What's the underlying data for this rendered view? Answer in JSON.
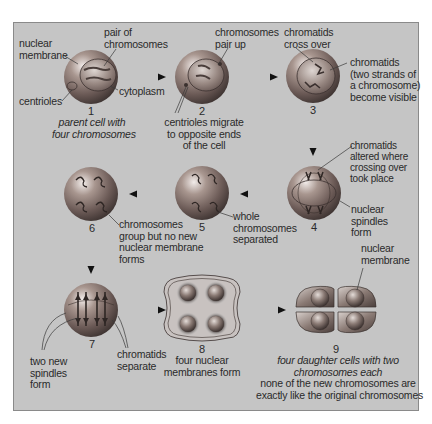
{
  "diagram": {
    "colors": {
      "panel_bg": "#c5c5c5",
      "cell_dark": "#5a4d4a",
      "cell_light": "#d8d0cc",
      "arrow": "#222222"
    },
    "stages": [
      {
        "number": "1",
        "caption": "parent cell with four chromosomes",
        "labels": [
          "nuclear membrane",
          "pair of chromosomes",
          "centrioles",
          "cytoplasm"
        ]
      },
      {
        "number": "2",
        "caption": "centrioles migrate to opposite ends of the cell",
        "labels": [
          "chromosomes pair up"
        ]
      },
      {
        "number": "3",
        "caption": "",
        "labels": [
          "chromatids cross over",
          "chromatids (two strands of a chromosome) become visible"
        ]
      },
      {
        "number": "4",
        "caption": "",
        "labels": [
          "chromatids altered where crossing over took place",
          "nuclear spindles form"
        ]
      },
      {
        "number": "5",
        "caption": "",
        "labels": [
          "whole chromosomes separated"
        ]
      },
      {
        "number": "6",
        "caption": "",
        "labels": [
          "chromosomes group but no new nuclear membrane forms"
        ]
      },
      {
        "number": "7",
        "caption": "",
        "labels": [
          "two new spindles form",
          "chromatids separate"
        ]
      },
      {
        "number": "8",
        "caption": "four nuclear membranes form",
        "labels": []
      },
      {
        "number": "9",
        "caption": "four daughter cells with two chromosomes each",
        "labels": [
          "nuclear membrane"
        ],
        "note": "none of the new chromosomes are exactly like the original chromosomes"
      }
    ]
  },
  "text": {
    "s1_nuclear": [
      "nuclear",
      "membrane"
    ],
    "s1_pair": [
      "pair of",
      "chromosomes"
    ],
    "s1_centrioles": "centrioles",
    "s1_cytoplasm": "cytoplasm",
    "s1_caption": [
      "parent cell with",
      "four chromosomes"
    ],
    "s2_pair": [
      "chromosomes",
      "pair up"
    ],
    "s2_caption": [
      "centrioles migrate",
      "to opposite ends",
      "of the cell"
    ],
    "s3_cross": [
      "chromatids",
      "cross over"
    ],
    "s3_visible": [
      "chromatids",
      "(two strands of",
      "a chromosome)",
      "become visible"
    ],
    "s4_altered": [
      "chromatids",
      "altered where",
      "crossing over",
      "took place"
    ],
    "s4_spindles": [
      "nuclear",
      "spindles",
      "form"
    ],
    "s5_whole": [
      "whole",
      "chromosomes",
      "separated"
    ],
    "s6_group": [
      "chromosomes",
      "group but no new",
      "nuclear membrane",
      "forms"
    ],
    "s7_spindles": [
      "two new",
      "spindles",
      "form"
    ],
    "s7_separate": [
      "chromatids",
      "separate"
    ],
    "s8_caption": [
      "four nuclear",
      "membranes form"
    ],
    "s9_nuclear": [
      "nuclear",
      "membrane"
    ],
    "s9_caption": [
      "four daughter cells with two",
      "chromosomes each"
    ],
    "s9_note": [
      "none of the new chromosomes are",
      "exactly like the original chromosomes"
    ],
    "n1": "1",
    "n2": "2",
    "n3": "3",
    "n4": "4",
    "n5": "5",
    "n6": "6",
    "n7": "7",
    "n8": "8",
    "n9": "9"
  }
}
